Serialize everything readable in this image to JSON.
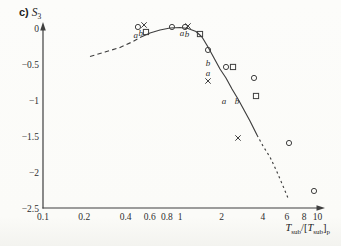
{
  "figure": {
    "panel_label": "c)",
    "y_symbol": "S",
    "y_symbol_sub": "3",
    "x_label": {
      "T1": "T",
      "sub1": "sub",
      "divider": "/[",
      "T2": "T",
      "sub2": "sub",
      "close": "]",
      "psub": "p"
    }
  },
  "colors": {
    "ink": "#3f3f3f",
    "text": "#2e2e2e",
    "paper": "#fbfbf8"
  },
  "chart_data": {
    "type": "scatter",
    "xlabel": "Tsub/[Tsub]p",
    "ylabel": "S3",
    "x_scale": "log",
    "xlim": [
      0.1,
      10
    ],
    "ylim": [
      -2.5,
      0
    ],
    "grid": false,
    "x_ticks": [
      {
        "v": 0.1,
        "label": "0.1"
      },
      {
        "v": 0.2,
        "label": "0.2"
      },
      {
        "v": 0.4,
        "label": "0.4"
      },
      {
        "v": 0.6,
        "label": "0.6"
      },
      {
        "v": 0.8,
        "label": "0.8"
      },
      {
        "v": 1,
        "label": "1"
      },
      {
        "v": 2,
        "label": "2"
      },
      {
        "v": 4,
        "label": "4"
      },
      {
        "v": 6,
        "label": "6"
      },
      {
        "v": 8,
        "label": "8"
      },
      {
        "v": 10,
        "label": "10"
      }
    ],
    "y_ticks": [
      {
        "v": 0,
        "label": "0"
      },
      {
        "v": -0.5,
        "label": "−0.5"
      },
      {
        "v": -1,
        "label": "−1"
      },
      {
        "v": -1.5,
        "label": "−1.5"
      },
      {
        "v": -2,
        "label": "−2"
      },
      {
        "v": -2.5,
        "label": "−2.5"
      }
    ],
    "series": [
      {
        "name": "circles",
        "marker": "circle",
        "points": [
          [
            0.492,
            0.028
          ],
          [
            0.871,
            0.028
          ],
          [
            1.084,
            0.028
          ],
          [
            1.595,
            -0.292
          ],
          [
            2.157,
            -0.529
          ],
          [
            3.451,
            -0.682
          ],
          [
            6.209,
            -1.588
          ],
          [
            9.445,
            -2.256
          ]
        ]
      },
      {
        "name": "crosses-a",
        "marker": "cross",
        "points": [
          [
            0.545,
            0.056
          ],
          [
            1.14,
            0.042
          ],
          [
            1.595,
            -0.724
          ],
          [
            2.638,
            -1.518
          ]
        ]
      },
      {
        "name": "squares-b",
        "marker": "square",
        "points": [
          [
            0.563,
            -0.042
          ],
          [
            1.394,
            -0.07
          ],
          [
            2.426,
            -0.529
          ],
          [
            3.569,
            -0.933
          ]
        ]
      }
    ],
    "curve_segments": [
      {
        "style": "dashed",
        "points": [
          [
            0.22,
            -0.383
          ],
          [
            0.283,
            -0.32
          ],
          [
            0.364,
            -0.258
          ],
          [
            0.445,
            -0.181
          ],
          [
            0.509,
            -0.118
          ]
        ]
      },
      {
        "style": "solid",
        "points": [
          [
            0.509,
            -0.118
          ],
          [
            0.602,
            -0.056
          ],
          [
            0.712,
            -0.014
          ],
          [
            0.843,
            0.014
          ],
          [
            0.997,
            0.021
          ],
          [
            1.14,
            0.007
          ],
          [
            1.304,
            -0.035
          ],
          [
            1.442,
            -0.111
          ],
          [
            1.595,
            -0.251
          ],
          [
            1.763,
            -0.404
          ],
          [
            1.95,
            -0.557
          ],
          [
            2.157,
            -0.682
          ],
          [
            2.385,
            -0.836
          ],
          [
            2.638,
            -0.975
          ],
          [
            2.917,
            -1.128
          ],
          [
            3.227,
            -1.281
          ],
          [
            3.63,
            -1.476
          ]
        ]
      },
      {
        "style": "dashed",
        "points": [
          [
            3.63,
            -1.476
          ],
          [
            4.014,
            -1.63
          ],
          [
            4.514,
            -1.783
          ],
          [
            5.076,
            -1.992
          ],
          [
            5.615,
            -2.187
          ],
          [
            6.105,
            -2.354
          ]
        ]
      }
    ],
    "annotations": [
      {
        "text": "a",
        "x": 0.474,
        "y": -0.088
      },
      {
        "text": "b",
        "x": 0.515,
        "y": -0.056
      },
      {
        "text": "a",
        "x": 1.031,
        "y": -0.056
      },
      {
        "text": "b",
        "x": 1.121,
        "y": -0.063
      },
      {
        "text": "b",
        "x": 1.595,
        "y": -0.474
      },
      {
        "text": "a",
        "x": 1.595,
        "y": -0.613
      },
      {
        "text": "a",
        "x": 2.086,
        "y": -1.003
      },
      {
        "text": "b",
        "x": 2.594,
        "y": -1.003
      }
    ]
  }
}
